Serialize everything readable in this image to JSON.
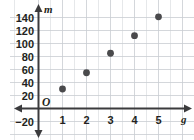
{
  "chart_data": {
    "type": "scatter",
    "title": "",
    "xlabel": "g",
    "ylabel": "m",
    "origin_label": "O",
    "x": [
      1,
      2,
      3,
      4,
      5
    ],
    "values": [
      30,
      55,
      85,
      112,
      141
    ],
    "points": [
      {
        "x": 1,
        "y": 30
      },
      {
        "x": 2,
        "y": 55
      },
      {
        "x": 3,
        "y": 85
      },
      {
        "x": 4,
        "y": 112
      },
      {
        "x": 5,
        "y": 141
      }
    ],
    "xlim": [
      -0.55,
      6.1
    ],
    "ylim": [
      -30,
      152
    ],
    "xticks": [
      1,
      2,
      3,
      4,
      5
    ],
    "xtick_labels": [
      "1",
      "2",
      "3",
      "4",
      "5"
    ],
    "yticks": [
      -20,
      20,
      40,
      60,
      80,
      100,
      120,
      140
    ],
    "ytick_labels": [
      "−20",
      "20",
      "40",
      "60",
      "80",
      "100",
      "120",
      "140"
    ],
    "grid": true,
    "grid_x_step": 0.5,
    "grid_y_step": 20,
    "legend": null,
    "marker": "filled-circle",
    "marker_color": "#4a4a4c",
    "grid_color": "#c9cdd2",
    "axis_color": "#3b3b3d",
    "background_color": "#ffffff"
  }
}
